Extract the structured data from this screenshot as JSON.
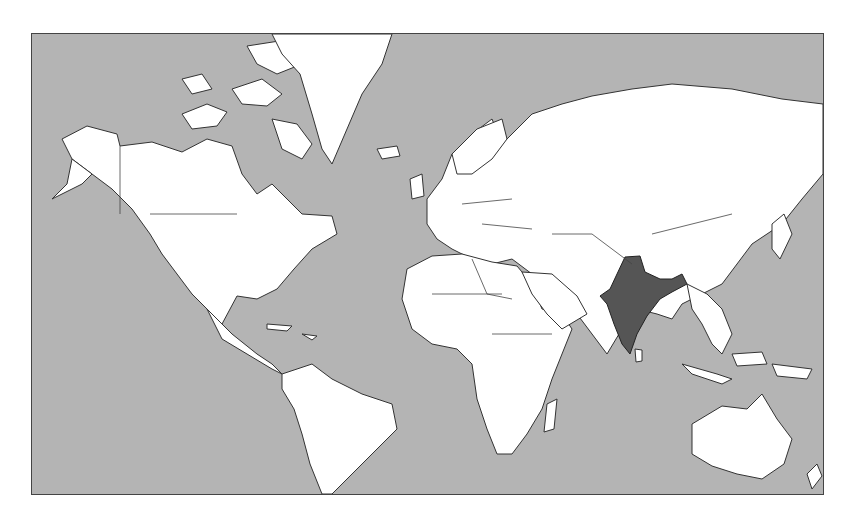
{
  "map": {
    "type": "world-choropleth",
    "projection": "Mercator",
    "colors": {
      "ocean": "#b4b4b4",
      "land": "#ffffff",
      "highlight": "#555555",
      "border": "#333333"
    },
    "highlighted_countries": [
      "India"
    ]
  }
}
